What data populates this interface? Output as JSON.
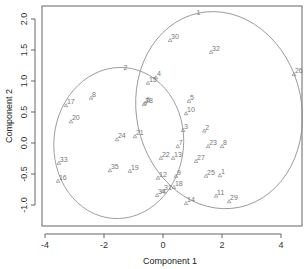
{
  "chart_data": {
    "type": "scatter",
    "title": "",
    "xlabel": "Component 1",
    "ylabel": "Component 2",
    "xlim": [
      -4.2,
      4.7
    ],
    "ylim": [
      -1.35,
      2.2
    ],
    "xticks": [
      -4,
      -2,
      0,
      2,
      4
    ],
    "xtick_labels": [
      "-4",
      "-2",
      "0",
      "2",
      "4"
    ],
    "yticks": [
      -1.0,
      -0.5,
      0.0,
      0.5,
      1.0,
      1.5,
      2.0
    ],
    "ytick_labels": [
      "-1.0",
      "-0.5",
      "0.0",
      "0.5",
      "1.0",
      "1.5",
      "2.0"
    ],
    "grid": false,
    "legend": null,
    "clusters": [
      {
        "label": "1",
        "center": [
          1.9,
          0.53
        ],
        "rx": 2.8,
        "ry": 1.6,
        "angle_deg": 12
      },
      {
        "label": "2",
        "center": [
          -1.5,
          0.0
        ],
        "rx": 2.2,
        "ry": 1.22,
        "angle_deg": -5
      }
    ],
    "points": [
      {
        "label": "1",
        "x": 1.93,
        "y": -0.52
      },
      {
        "label": "2",
        "x": 1.4,
        "y": 0.2
      },
      {
        "label": "3",
        "x": 0.68,
        "y": 0.21
      },
      {
        "label": "4",
        "x": -0.24,
        "y": 1.06
      },
      {
        "label": "5",
        "x": 0.88,
        "y": 0.68
      },
      {
        "label": "6",
        "x": -0.6,
        "y": 0.65
      },
      {
        "label": "7",
        "x": 0.5,
        "y": -0.05
      },
      {
        "label": "8",
        "x": -2.44,
        "y": 0.73
      },
      {
        "label": "9",
        "x": 0.44,
        "y": -0.53
      },
      {
        "label": "10",
        "x": 0.78,
        "y": 0.48
      },
      {
        "label": "11",
        "x": 1.8,
        "y": -0.85
      },
      {
        "label": "12",
        "x": -0.17,
        "y": -0.56
      },
      {
        "label": "13",
        "x": 0.34,
        "y": -0.24
      },
      {
        "label": "14",
        "x": 0.78,
        "y": -0.97
      },
      {
        "label": "15",
        "x": -0.51,
        "y": 0.97
      },
      {
        "label": "16",
        "x": -3.56,
        "y": -0.61
      },
      {
        "label": "17",
        "x": -3.29,
        "y": 0.61
      },
      {
        "label": "18",
        "x": 0.37,
        "y": -0.71
      },
      {
        "label": "19",
        "x": -1.12,
        "y": -0.45
      },
      {
        "label": "20",
        "x": -3.12,
        "y": 0.35
      },
      {
        "label": "21",
        "x": -0.95,
        "y": 0.11
      },
      {
        "label": "22",
        "x": -0.07,
        "y": -0.24
      },
      {
        "label": "23",
        "x": 1.53,
        "y": -0.05
      },
      {
        "label": "24",
        "x": -1.56,
        "y": 0.06
      },
      {
        "label": "25",
        "x": 1.46,
        "y": -0.53
      },
      {
        "label": "26",
        "x": 4.44,
        "y": 1.11
      },
      {
        "label": "27",
        "x": 1.12,
        "y": -0.29
      },
      {
        "label": "28",
        "x": -0.64,
        "y": 0.63
      },
      {
        "label": "29",
        "x": 2.24,
        "y": -0.94
      },
      {
        "label": "30",
        "x": 0.24,
        "y": 1.66
      },
      {
        "label": "31",
        "x": 0.0,
        "y": -0.77
      },
      {
        "label": "32",
        "x": 1.63,
        "y": 1.47
      },
      {
        "label": "33",
        "x": -3.53,
        "y": -0.32
      },
      {
        "label": "34",
        "x": -0.2,
        "y": -0.84
      },
      {
        "label": "35",
        "x": -1.8,
        "y": -0.44
      },
      {
        "label": "8",
        "x": 2.0,
        "y": -0.05
      }
    ]
  },
  "axes": {
    "x_title": "Component 1",
    "y_title": "Component 2"
  }
}
